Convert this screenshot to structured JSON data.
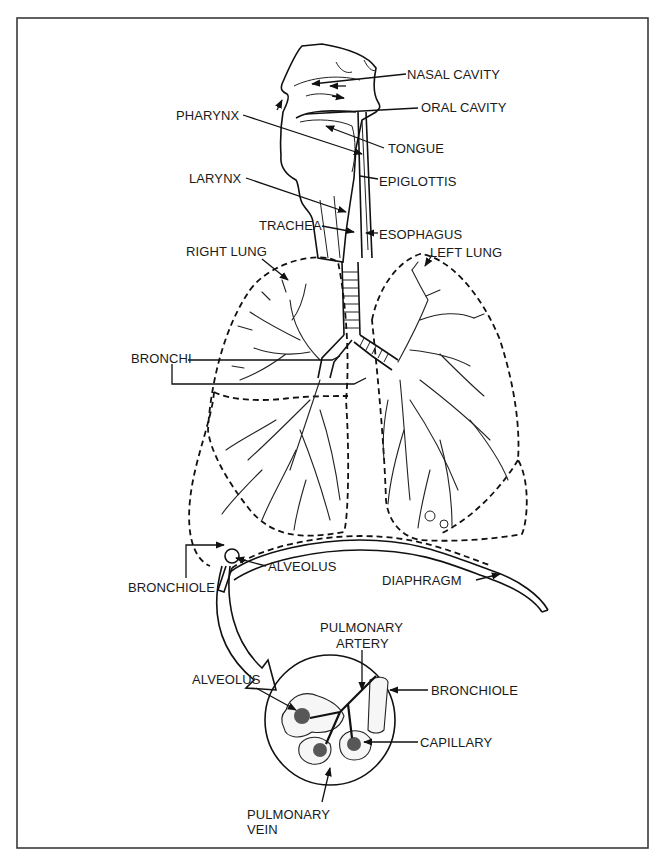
{
  "figure": {
    "labels": {
      "nasal_cavity": "NASAL CAVITY",
      "oral_cavity": "ORAL CAVITY",
      "pharynx": "PHARYNX",
      "tongue": "TONGUE",
      "larynx": "LARYNX",
      "epiglottis": "EPIGLOTTIS",
      "trachea": "TRACHEA",
      "esophagus": "ESOPHAGUS",
      "right_lung": "RIGHT LUNG",
      "left_lung": "LEFT LUNG",
      "bronchi": "BRONCHI",
      "bronchiole": "BRONCHIOLE",
      "alveolus": "ALVEOLUS",
      "diaphragm": "DIAPHRAGM"
    },
    "inset": {
      "labels": {
        "pulmonary_artery_line1": "PULMONARY",
        "pulmonary_artery_line2": "ARTERY",
        "alveolus": "ALVEOLUS",
        "bronchiole": "BRONCHIOLE",
        "capillary": "CAPILLARY",
        "pulmonary_vein_line1": "PULMONARY",
        "pulmonary_vein_line2": "VEIN"
      }
    }
  },
  "colors": {
    "ink": "#111111",
    "background": "#ffffff",
    "frame": "#3a3a3a"
  }
}
